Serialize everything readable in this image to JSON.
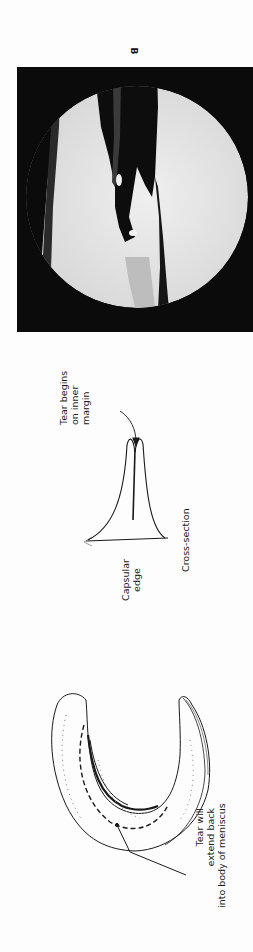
{
  "figure": {
    "panel_label": "B",
    "photo": {
      "description": "arthroscopic-view",
      "background": "#0b0b0b",
      "field": "#e6e6e6"
    },
    "cross_section": {
      "title": "Cross-section",
      "callout_top": [
        "Tear begins",
        "on inner",
        "margin"
      ],
      "callout_base": [
        "Capsular",
        "edge"
      ]
    },
    "meniscus": {
      "callout": [
        "Tear will",
        "extend back",
        "into body of meniscus"
      ]
    }
  }
}
